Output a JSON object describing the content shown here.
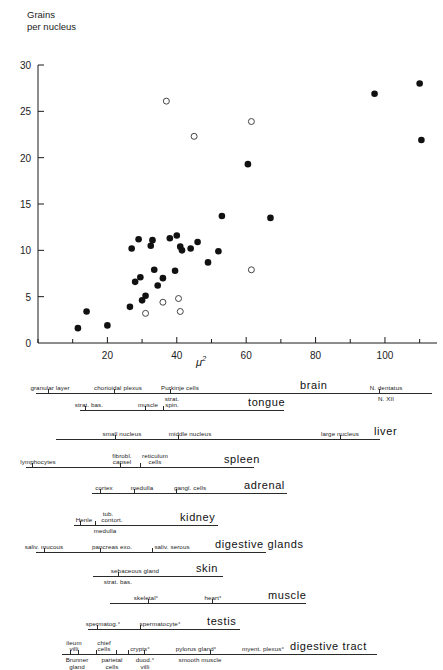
{
  "chart_data": {
    "type": "scatter",
    "title": "",
    "ylabel_line1": "Grains",
    "ylabel_line2": "per nucleus",
    "xlabel": "μ²",
    "xlim": [
      0,
      115
    ],
    "ylim": [
      0,
      30
    ],
    "xticks": [
      20,
      40,
      60,
      80,
      100
    ],
    "yticks": [
      0,
      5,
      10,
      15,
      20,
      25,
      30
    ],
    "xminor_step": 10,
    "grid": false,
    "legend": "",
    "series": [
      {
        "name": "filled-circles",
        "marker": "filled circle",
        "points": [
          [
            11.5,
            1.6
          ],
          [
            14.0,
            3.4
          ],
          [
            20.0,
            1.9
          ],
          [
            26.5,
            3.9
          ],
          [
            27.0,
            10.2
          ],
          [
            28.0,
            6.6
          ],
          [
            29.0,
            11.2
          ],
          [
            29.5,
            7.1
          ],
          [
            30.0,
            4.6
          ],
          [
            31.0,
            5.1
          ],
          [
            32.5,
            10.5
          ],
          [
            33.0,
            11.1
          ],
          [
            33.5,
            7.9
          ],
          [
            34.5,
            6.2
          ],
          [
            36.0,
            7.0
          ],
          [
            38.0,
            11.3
          ],
          [
            39.5,
            7.8
          ],
          [
            40.0,
            11.6
          ],
          [
            41.0,
            10.4
          ],
          [
            41.5,
            10.0
          ],
          [
            44.0,
            10.2
          ],
          [
            46.0,
            10.9
          ],
          [
            49.0,
            8.7
          ],
          [
            52.0,
            9.9
          ],
          [
            53.0,
            13.7
          ],
          [
            60.5,
            19.3
          ],
          [
            67.0,
            13.5
          ],
          [
            97.0,
            26.9
          ],
          [
            110.0,
            28.0
          ],
          [
            110.5,
            21.9
          ]
        ]
      },
      {
        "name": "open-circles",
        "marker": "open circle",
        "points": [
          [
            31.0,
            3.2
          ],
          [
            36.0,
            4.4
          ],
          [
            37.0,
            26.1
          ],
          [
            40.5,
            4.8
          ],
          [
            41.0,
            3.4
          ],
          [
            45.0,
            22.3
          ],
          [
            61.5,
            23.9
          ],
          [
            61.5,
            7.9
          ]
        ]
      }
    ]
  },
  "diagram": {
    "rows": [
      {
        "organ": "brain",
        "organ_x": 300,
        "organ_y": 9,
        "line_x": 36,
        "line_w": 396,
        "line_y": 22,
        "ticks": [
          48,
          114,
          170,
          379
        ],
        "labels_above": [
          {
            "text": "granular layer",
            "x": 50
          },
          {
            "text": "chorioidal plexus",
            "x": 118
          },
          {
            "text": "Purkinje cells",
            "x": 180
          },
          {
            "text": "N. dentatus",
            "x": 386
          }
        ],
        "labels_below": [
          {
            "text": "N. XII",
            "x": 386
          }
        ]
      },
      {
        "organ": "tongue",
        "organ_x": 248,
        "organ_y": 24,
        "line_x": 80,
        "line_w": 204,
        "line_y": 39,
        "ticks": [
          85,
          145,
          163
        ],
        "labels_above": [
          {
            "text": "strat. bas.",
            "x": 89
          },
          {
            "text": "muscle",
            "x": 148
          },
          {
            "text": "strat.",
            "x": 172,
            "dy": -6
          },
          {
            "text": "spin.",
            "x": 172
          }
        ],
        "labels_below": []
      },
      {
        "organ": "liver",
        "organ_x": 374,
        "organ_y": 53,
        "line_x": 56,
        "line_w": 324,
        "line_y": 68,
        "ticks": [
          115,
          178,
          340
        ],
        "labels_above": [
          {
            "text": "small nucleus",
            "x": 122
          },
          {
            "text": "middle nucleus",
            "x": 190
          },
          {
            "text": "large nucleus",
            "x": 340
          }
        ],
        "labels_below": []
      },
      {
        "organ": "spleen",
        "organ_x": 224,
        "organ_y": 80,
        "line_x": 26,
        "line_w": 228,
        "line_y": 96,
        "ticks": [
          32,
          120,
          140
        ],
        "labels_above": [
          {
            "text": "lymphocytes",
            "x": 38
          },
          {
            "text": "fibrobl.",
            "x": 122,
            "dy": -6
          },
          {
            "text": "capsel",
            "x": 122
          },
          {
            "text": "reticulum",
            "x": 155,
            "dy": -6
          },
          {
            "text": "cells",
            "x": 155
          }
        ],
        "labels_below": []
      },
      {
        "organ": "adrenal",
        "organ_x": 244,
        "organ_y": 107,
        "line_x": 92,
        "line_w": 195,
        "line_y": 122,
        "ticks": [
          100,
          134,
          176
        ],
        "labels_above": [
          {
            "text": "cortex",
            "x": 104
          },
          {
            "text": "medulla",
            "x": 142
          },
          {
            "text": "gangl. cells",
            "x": 190
          }
        ],
        "labels_below": []
      },
      {
        "organ": "kidney",
        "organ_x": 180,
        "organ_y": 133,
        "line_x": 74,
        "line_w": 144,
        "line_y": 154,
        "ticks": [
          80,
          95
        ],
        "labels_above": [
          {
            "text": "tub.",
            "x": 108,
            "dy": -6
          },
          {
            "text": "Henle",
            "x": 84
          },
          {
            "text": "contort.",
            "x": 112
          }
        ],
        "labels_below": [
          {
            "text": "medulla",
            "x": 105
          }
        ]
      },
      {
        "organ": "digestive glands",
        "organ_x": 215,
        "organ_y": 165,
        "line_x": 36,
        "line_w": 230,
        "line_y": 181,
        "ticks": [
          44,
          100,
          152
        ],
        "labels_above": [
          {
            "text": "saliv. mucous",
            "x": 44
          },
          {
            "text": "pancreas exo.",
            "x": 112
          },
          {
            "text": "saliv. serous",
            "x": 172
          }
        ],
        "labels_below": []
      },
      {
        "organ": "skin",
        "organ_x": 196,
        "organ_y": 190,
        "line_x": 93,
        "line_w": 130,
        "line_y": 205,
        "ticks": [
          118
        ],
        "labels_above": [
          {
            "text": "sebaceous gland",
            "x": 135
          }
        ],
        "labels_below": [
          {
            "text": "strat. bas.",
            "x": 118
          }
        ]
      },
      {
        "organ": "muscle",
        "organ_x": 268,
        "organ_y": 216,
        "line_x": 110,
        "line_w": 196,
        "line_y": 232,
        "ticks": [
          148,
          212
        ],
        "labels_above": [
          {
            "text": "skeletal°",
            "x": 146
          },
          {
            "text": "heart°",
            "x": 213
          }
        ],
        "labels_below": []
      },
      {
        "organ": "testis",
        "organ_x": 207,
        "organ_y": 242,
        "line_x": 88,
        "line_w": 152,
        "line_y": 258,
        "ticks": [
          97,
          140
        ],
        "labels_above": [
          {
            "text": "spermatog.°",
            "x": 103
          },
          {
            "text": "spermatocyte°",
            "x": 160
          }
        ],
        "labels_below": []
      },
      {
        "organ": "digestive tract",
        "organ_x": 290,
        "organ_y": 272,
        "line_x": 62,
        "line_w": 315,
        "line_y": 283,
        "ticks": [
          70,
          78,
          96,
          116,
          128,
          144,
          210
        ],
        "labels_above": [
          {
            "text": "ileum",
            "x": 74,
            "dy": -6
          },
          {
            "text": "villi",
            "x": 74
          },
          {
            "text": "chief",
            "x": 104,
            "dy": -6
          },
          {
            "text": "cells",
            "x": 104
          },
          {
            "text": "crypts°",
            "x": 140
          },
          {
            "text": "pylorus gland°",
            "x": 196
          },
          {
            "text": "myent. plexus°",
            "x": 263
          }
        ],
        "labels_below": [
          {
            "text": "Brunner",
            "x": 77
          },
          {
            "text": "gland",
            "x": 77,
            "dy": 7
          },
          {
            "text": "parietal",
            "x": 112
          },
          {
            "text": "cells",
            "x": 112,
            "dy": 7
          },
          {
            "text": "duod.°",
            "x": 145
          },
          {
            "text": "villi",
            "x": 145,
            "dy": 7
          },
          {
            "text": "smooth muscle",
            "x": 200
          }
        ]
      }
    ]
  }
}
